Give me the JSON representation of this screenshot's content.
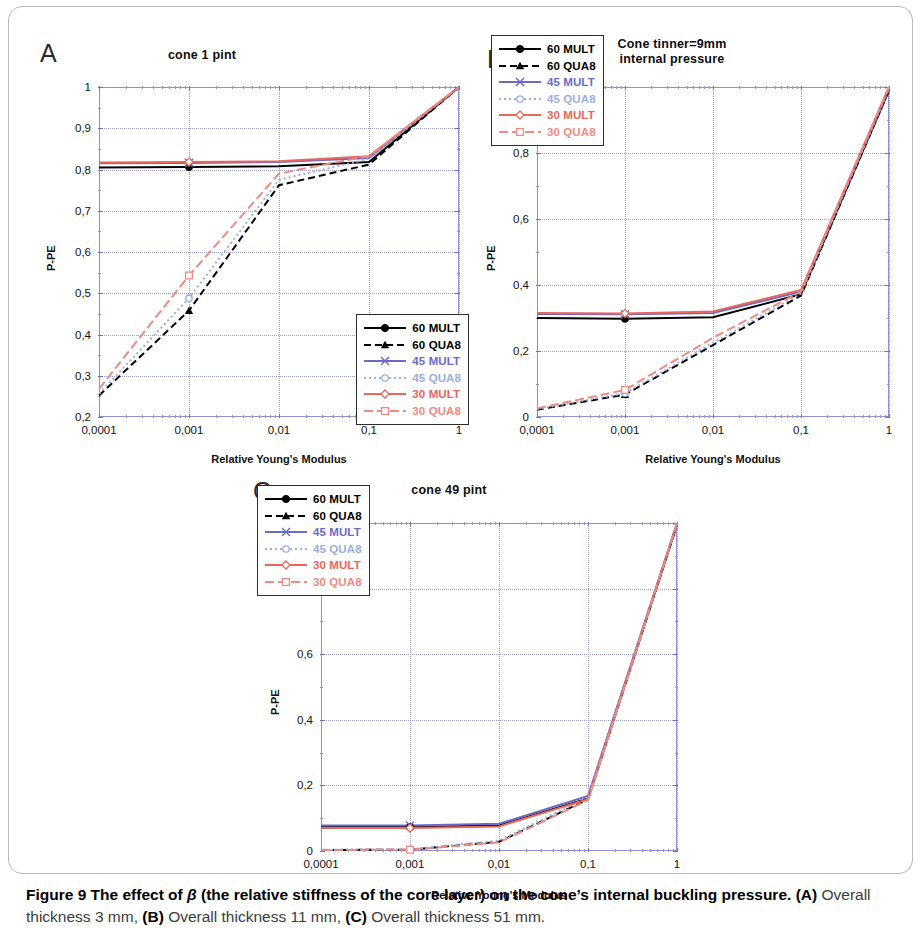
{
  "figure": {
    "caption_lead": "Figure 9 The effect of",
    "caption_beta": "β",
    "caption_lead_rest": "(the relative stiffness of the core layer) on the cone’s internal buckling pressure.",
    "caption_a_tag": "(A)",
    "caption_a_text": "Overall thickness 3 mm,",
    "caption_b_tag": "(B)",
    "caption_b_text": "Overall thickness 11 mm,",
    "caption_c_tag": "(C)",
    "caption_c_text": "Overall thickness 51 mm."
  },
  "colors": {
    "black": "#000000",
    "blue": "#6a6ac8",
    "light_blue": "#9aaee0",
    "red": "#e8665a",
    "light_red": "#ef8a80",
    "axis": "#8f8fd4",
    "grid": "#9a9ad0"
  },
  "panels": [
    {
      "letter": "A",
      "title": "cone 1 pint",
      "xlabel": "Relative Young's Modulus",
      "ylabel": "P-PE",
      "legend_position": "bottom-right"
    },
    {
      "letter": "B",
      "title": "Cone tinner=9mm\ninternal pressure",
      "title_line1": "Cone tinner=9mm",
      "title_line2": "internal pressure",
      "xlabel": "Relative Young's Modulus",
      "ylabel": "P-PE",
      "legend_position": "top-left"
    },
    {
      "letter": "C",
      "title": "cone 49 pint",
      "xlabel": "Relative Young's Modulus",
      "ylabel": "P-PE",
      "legend_position": "top-left"
    }
  ],
  "legend_entries": [
    {
      "label": "60 MULT",
      "color": "#000000",
      "dash": "solid",
      "marker": "circle-filled"
    },
    {
      "label": "60 QUA8",
      "color": "#000000",
      "dash": "dashed",
      "marker": "triangle-filled"
    },
    {
      "label": "45 MULT",
      "color": "#6a6ac8",
      "dash": "solid",
      "marker": "cross"
    },
    {
      "label": "45 QUA8",
      "color": "#9aaee0",
      "dash": "dotted",
      "marker": "circle-open"
    },
    {
      "label": "30 MULT",
      "color": "#e8665a",
      "dash": "solid",
      "marker": "diamond"
    },
    {
      "label": "30 QUA8",
      "color": "#ef8a80",
      "dash": "dashdot",
      "marker": "square-open"
    }
  ],
  "chart_data": [
    {
      "type": "line",
      "panel": "A",
      "title": "cone 1 pint",
      "xlabel": "Relative Young's Modulus",
      "ylabel": "P-PE",
      "xscale": "log",
      "xlim": [
        0.0001,
        1
      ],
      "ylim": [
        0.2,
        1
      ],
      "xticks": [
        0.0001,
        0.001,
        0.01,
        0.1,
        1
      ],
      "xticklabels": [
        "0,0001",
        "0,001",
        "0,01",
        "0,1",
        "1"
      ],
      "yticks": [
        0.2,
        0.3,
        0.4,
        0.5,
        0.6,
        0.7,
        0.8,
        0.9,
        1
      ],
      "yticklabels": [
        "0,2",
        "0,3",
        "0,4",
        "0,5",
        "0,6",
        "0,7",
        "0,8",
        "0,9",
        "1"
      ],
      "grid": true,
      "x": [
        0.0001,
        0.001,
        0.01,
        0.1,
        1
      ],
      "series": [
        {
          "name": "60 MULT",
          "values": [
            0.805,
            0.806,
            0.808,
            0.818,
            1.0
          ]
        },
        {
          "name": "60 QUA8",
          "values": [
            0.252,
            0.458,
            0.762,
            0.812,
            1.0
          ]
        },
        {
          "name": "45 MULT",
          "values": [
            0.815,
            0.816,
            0.818,
            0.828,
            1.0
          ]
        },
        {
          "name": "45 QUA8",
          "values": [
            0.256,
            0.488,
            0.775,
            0.826,
            1.0
          ]
        },
        {
          "name": "30 MULT",
          "values": [
            0.817,
            0.818,
            0.82,
            0.832,
            1.0
          ]
        },
        {
          "name": "30 QUA8",
          "values": [
            0.268,
            0.543,
            0.79,
            0.833,
            1.0
          ]
        }
      ]
    },
    {
      "type": "line",
      "panel": "B",
      "title": "Cone tinner=9mm internal pressure",
      "xlabel": "Relative Young's Modulus",
      "ylabel": "P-PE",
      "xscale": "log",
      "xlim": [
        0.0001,
        1
      ],
      "ylim": [
        0,
        1
      ],
      "xticks": [
        0.0001,
        0.001,
        0.01,
        0.1,
        1
      ],
      "xticklabels": [
        "0,0001",
        "0,001",
        "0,01",
        "0,1",
        "1"
      ],
      "yticks": [
        0,
        0.2,
        0.4,
        0.6,
        0.8,
        1
      ],
      "yticklabels": [
        "0",
        "0,2",
        "0,4",
        "0,6",
        "0,8",
        "1"
      ],
      "grid": true,
      "x": [
        0.0001,
        0.001,
        0.01,
        0.1,
        1
      ],
      "series": [
        {
          "name": "60 MULT",
          "values": [
            0.3,
            0.298,
            0.302,
            0.372,
            0.99
          ]
        },
        {
          "name": "60 QUA8",
          "values": [
            0.022,
            0.068,
            0.218,
            0.368,
            0.99
          ]
        },
        {
          "name": "45 MULT",
          "values": [
            0.312,
            0.311,
            0.315,
            0.38,
            0.995
          ]
        },
        {
          "name": "45 QUA8",
          "values": [
            0.024,
            0.072,
            0.225,
            0.374,
            0.995
          ]
        },
        {
          "name": "30 MULT",
          "values": [
            0.315,
            0.314,
            0.32,
            0.385,
            1.0
          ]
        },
        {
          "name": "30 QUA8",
          "values": [
            0.026,
            0.082,
            0.24,
            0.38,
            1.0
          ]
        }
      ]
    },
    {
      "type": "line",
      "panel": "C",
      "title": "cone 49 pint",
      "xlabel": "Relative Young's Modulus",
      "ylabel": "P-PE",
      "xscale": "log",
      "xlim": [
        0.0001,
        1
      ],
      "ylim": [
        0,
        1
      ],
      "xticks": [
        0.0001,
        0.001,
        0.01,
        0.1,
        1
      ],
      "xticklabels": [
        "0,0001",
        "0,001",
        "0,01",
        "0,1",
        "1"
      ],
      "yticks": [
        0,
        0.2,
        0.4,
        0.6,
        0.8,
        1
      ],
      "yticklabels": [
        "0",
        "0,2",
        "0,4",
        "0,6",
        "0,8",
        "1"
      ],
      "grid": true,
      "x": [
        0.0001,
        0.001,
        0.01,
        0.1,
        1
      ],
      "series": [
        {
          "name": "60 MULT",
          "values": [
            0.073,
            0.073,
            0.078,
            0.16,
            0.995
          ]
        },
        {
          "name": "60 QUA8",
          "values": [
            0.003,
            0.004,
            0.028,
            0.158,
            0.995
          ]
        },
        {
          "name": "45 MULT",
          "values": [
            0.078,
            0.078,
            0.083,
            0.168,
            1.0
          ]
        },
        {
          "name": "45 QUA8",
          "values": [
            0.004,
            0.005,
            0.032,
            0.164,
            1.0
          ]
        },
        {
          "name": "30 MULT",
          "values": [
            0.07,
            0.07,
            0.075,
            0.158,
            0.998
          ]
        },
        {
          "name": "30 QUA8",
          "values": [
            0.003,
            0.004,
            0.026,
            0.155,
            0.998
          ]
        }
      ]
    }
  ]
}
